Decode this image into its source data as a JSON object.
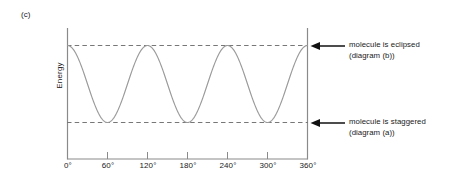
{
  "panel": {
    "label": "(c)"
  },
  "axes": {
    "ylabel": "Energy",
    "xticks": [
      {
        "label": "0°",
        "value": 0
      },
      {
        "label": "60°",
        "value": 60
      },
      {
        "label": "120°",
        "value": 120
      },
      {
        "label": "180°",
        "value": 180
      },
      {
        "label": "240°",
        "value": 240
      },
      {
        "label": "300°",
        "value": 300
      },
      {
        "label": "360°",
        "value": 360
      }
    ]
  },
  "annotations": {
    "eclipsed": {
      "line1": "molecule is eclipsed",
      "line2": "(diagram (b))",
      "arrow": "arrow-left-icon"
    },
    "staggered": {
      "line1": "molecule is staggered",
      "line2": "(diagram (a))",
      "arrow": "arrow-left-icon"
    }
  },
  "colors": {
    "curve": "#9a9a9a",
    "axis": "#8a8a8a",
    "dashed": "#7a7a7a",
    "arrow": "#111111",
    "text": "#1a1a1a",
    "background": "#ffffff"
  },
  "chart_data": {
    "type": "line",
    "title": "",
    "xlabel": "",
    "ylabel": "Energy",
    "xlim": [
      0,
      360
    ],
    "ylim": [
      0,
      1
    ],
    "xtick_values": [
      0,
      60,
      120,
      180,
      240,
      300,
      360
    ],
    "xtick_labels": [
      "0°",
      "60°",
      "120°",
      "180°",
      "240°",
      "300°",
      "360°"
    ],
    "ytick_labels": [],
    "grid": false,
    "legend": null,
    "series": [
      {
        "name": "torsional energy",
        "form": "cosine",
        "periods": 3,
        "period_degrees": 120,
        "maxima_at": [
          0,
          120,
          240,
          360
        ],
        "minima_at": [
          60,
          180,
          300
        ],
        "max_level": 1,
        "min_level": 0,
        "x": [
          0,
          10,
          20,
          30,
          40,
          50,
          60,
          70,
          80,
          90,
          100,
          110,
          120,
          130,
          140,
          150,
          160,
          170,
          180,
          190,
          200,
          210,
          220,
          230,
          240,
          250,
          260,
          270,
          280,
          290,
          300,
          310,
          320,
          330,
          340,
          350,
          360
        ],
        "y": [
          1,
          0.983,
          0.933,
          0.854,
          0.75,
          0.629,
          0.5,
          0.371,
          0.25,
          0.146,
          0.067,
          0.017,
          0,
          0.017,
          0.067,
          0.146,
          0.25,
          0.371,
          0.5,
          0.629,
          0.75,
          0.854,
          0.933,
          0.983,
          1,
          0.983,
          0.933,
          0.854,
          0.75,
          0.629,
          0.5,
          0.371,
          0.25,
          0.146,
          0.067,
          0.017,
          0
        ]
      }
    ],
    "reference_lines": [
      {
        "name": "eclipsed-level",
        "y": 1,
        "style": "dashed",
        "label": "molecule is eclipsed (diagram (b))"
      },
      {
        "name": "staggered-level",
        "y": 0,
        "style": "dashed",
        "label": "molecule is staggered (diagram (a))"
      }
    ]
  }
}
